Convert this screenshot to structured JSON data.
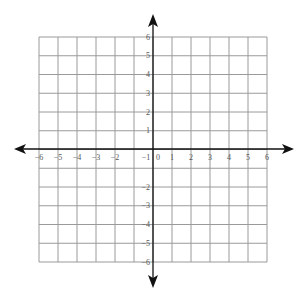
{
  "chart_data": {
    "type": "scatter",
    "title": "",
    "xlabel": "",
    "ylabel": "",
    "xlim": [
      -6,
      6
    ],
    "ylim": [
      -6,
      6
    ],
    "grid": true,
    "x_ticks": [
      "−6",
      "−5",
      "−4",
      "−3",
      "−2",
      "−1",
      "0",
      "1",
      "2",
      "3",
      "4",
      "5",
      "6"
    ],
    "y_ticks_positive": [
      "6",
      "5",
      "4",
      "3",
      "2",
      "1"
    ],
    "y_ticks_negative": [
      "−2",
      "−3",
      "−4",
      "−5",
      "−6"
    ],
    "series": [],
    "legend": null
  },
  "colors": {
    "grid": "#9a9a9a",
    "axis": "#111111",
    "label": "#555555",
    "background": "#ffffff"
  }
}
